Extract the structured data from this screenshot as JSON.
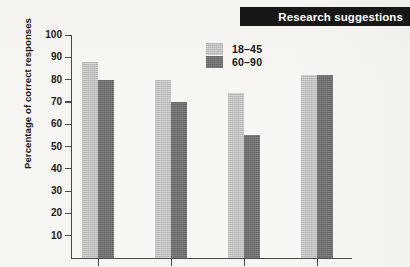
{
  "banner": {
    "title": "Research suggestions",
    "background_color": "#171717",
    "text_color": "#ffffff"
  },
  "chart_data": {
    "type": "bar",
    "title": "Research suggestions",
    "xlabel": "",
    "ylabel": "Percentage of correct responses",
    "ylim": [
      0,
      100
    ],
    "ytick_labels": [
      "100",
      "90",
      "80",
      "70",
      "60",
      "50",
      "40",
      "30",
      "20",
      "10"
    ],
    "yticks": [
      100,
      90,
      80,
      70,
      60,
      50,
      40,
      30,
      20,
      10
    ],
    "grid": false,
    "legend_position": "upper-center",
    "categories": [
      "1",
      "2",
      "3",
      "4"
    ],
    "category_labels_visible": false,
    "series": [
      {
        "name": "18-45",
        "color": "#bdbdbd",
        "values": [
          88,
          80,
          74,
          82
        ]
      },
      {
        "name": "60-90",
        "color": "#6e6e6e",
        "values": [
          80,
          70,
          55,
          82
        ]
      }
    ]
  },
  "legend": {
    "entries": [
      {
        "label": "18–45",
        "swatch": "light"
      },
      {
        "label": "60–90",
        "swatch": "dark"
      }
    ]
  },
  "axis": {
    "y_title": "Percentage of correct responses"
  }
}
